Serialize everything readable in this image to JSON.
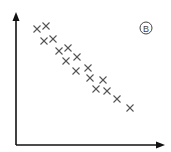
{
  "chart_data": {
    "type": "scatter",
    "title": "",
    "panel_label": "B",
    "xlabel": "",
    "ylabel": "",
    "grid": false,
    "legend": null,
    "trend": "negative correlation",
    "marker": "x",
    "marker_color": "#555555",
    "axis_color": "#111111",
    "points_px": [
      [
        37,
        29
      ],
      [
        46,
        26
      ],
      [
        44,
        41
      ],
      [
        53,
        39
      ],
      [
        59,
        51
      ],
      [
        68,
        48
      ],
      [
        66,
        61
      ],
      [
        77,
        57
      ],
      [
        76,
        71
      ],
      [
        88,
        68
      ],
      [
        90,
        78
      ],
      [
        103,
        80
      ],
      [
        96,
        89
      ],
      [
        107,
        91
      ],
      [
        117,
        99
      ],
      [
        130,
        108
      ]
    ]
  },
  "labels": {
    "panel": "B"
  }
}
